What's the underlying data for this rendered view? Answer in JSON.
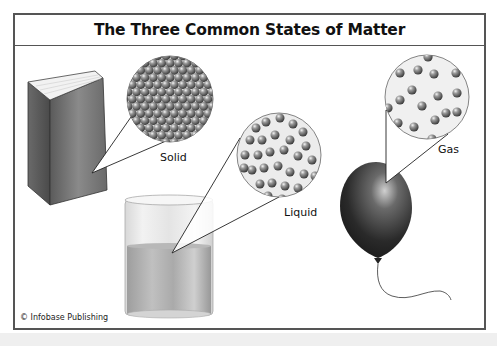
{
  "diagram": {
    "title": "The Three Common States of Matter",
    "credit": "© Infobase Publishing",
    "states": [
      {
        "name": "solid",
        "label": "Solid",
        "object": "book",
        "particle_arrangement": "tightly packed"
      },
      {
        "name": "liquid",
        "label": "Liquid",
        "object": "beaker of liquid",
        "particle_arrangement": "close but disordered"
      },
      {
        "name": "gas",
        "label": "Gas",
        "object": "balloon",
        "particle_arrangement": "widely spaced"
      }
    ]
  },
  "colors": {
    "frame": "#555555",
    "particle": "#7a7a7a",
    "balloon": "#2a2a2a",
    "liquid": "#b5b5b5"
  }
}
